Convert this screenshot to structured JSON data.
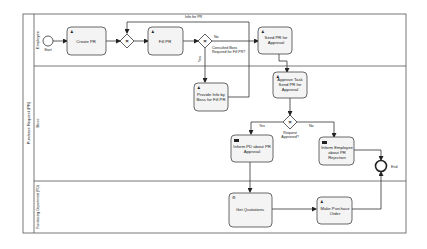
{
  "pool": {
    "label": "Purchase Request (PR)"
  },
  "lanes": [
    {
      "label": "Employee"
    },
    {
      "label": "Boss"
    },
    {
      "label": "Purchasing Department (PD)"
    }
  ],
  "events": {
    "start": {
      "label": "Start"
    },
    "end": {
      "label": "End"
    }
  },
  "tasks": {
    "create_pr": {
      "line1": "Create PR",
      "line2": ""
    },
    "fill_pr": {
      "line1": "Fill PR",
      "line2": ""
    },
    "send_pr": {
      "line1": "Send PR for",
      "line2": "Approval"
    },
    "provide_info": {
      "line1": "Provide Info by",
      "line2": "Boss for Fill PR"
    },
    "approve_task": {
      "line1": "Approve Task",
      "line2": "Send PR for",
      "line3": "Approval"
    },
    "inform_pd": {
      "line1": "Inform PD about PR",
      "line2": "Approval"
    },
    "inform_employee": {
      "line1": "Inform Employee",
      "line2": "about PR",
      "line3": "Rejection"
    },
    "get_quotations": {
      "line1": "Get Quotations"
    },
    "make_po": {
      "line1": "Make Purchase",
      "line2": "Order"
    }
  },
  "gateways": {
    "consulted_boss": {
      "line1": "Consulted Boss",
      "line2": "Required for Fill PR?"
    },
    "request_approved": {
      "line1": "Request",
      "line2": "Approved?"
    }
  },
  "flow_labels": {
    "info_for_pr": "Info for PR",
    "no_1": "No",
    "yes_1": "Yes",
    "yes_2": "Yes",
    "no_2": "No"
  }
}
